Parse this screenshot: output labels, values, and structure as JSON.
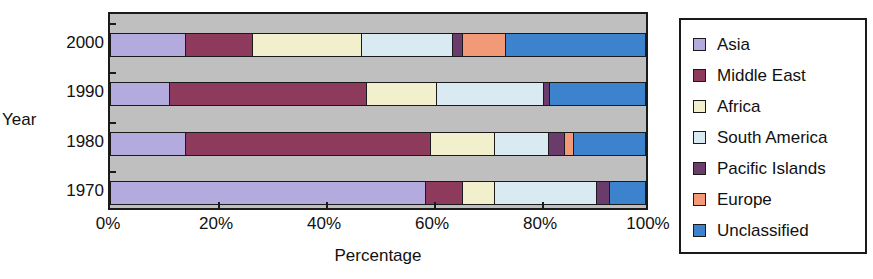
{
  "chart_data": {
    "type": "bar",
    "orientation": "horizontal",
    "stacked": true,
    "normalized": true,
    "title": "",
    "xlabel": "Percentage",
    "ylabel": "Year",
    "categories": [
      "2000",
      "1990",
      "1980",
      "1970"
    ],
    "category_order_top_to_bottom": [
      "2000",
      "1990",
      "1980",
      "1970"
    ],
    "xlim": [
      0,
      100
    ],
    "xtick_labels": [
      "0%",
      "20%",
      "40%",
      "60%",
      "80%",
      "100%"
    ],
    "xtick_values": [
      0,
      20,
      40,
      60,
      80,
      100
    ],
    "grid": false,
    "legend_position": "right",
    "series": [
      {
        "name": "Asia",
        "color": "#b3abdd",
        "values": [
          14.0,
          11.0,
          14.0,
          59.0
        ]
      },
      {
        "name": "Middle East",
        "color": "#8e3a5c",
        "values": [
          12.5,
          37.0,
          46.0,
          7.0
        ]
      },
      {
        "name": "Africa",
        "color": "#f2f0cc",
        "values": [
          20.5,
          13.0,
          12.0,
          6.0
        ]
      },
      {
        "name": "South America",
        "color": "#d9eaf3",
        "values": [
          17.0,
          20.0,
          10.0,
          19.0
        ]
      },
      {
        "name": "Pacific Islands",
        "color": "#6b3b6b",
        "values": [
          2.0,
          1.3,
          3.0,
          2.5
        ]
      },
      {
        "name": "Europe",
        "color": "#f29a78",
        "values": [
          8.0,
          0.0,
          1.7,
          0.0
        ]
      },
      {
        "name": "Unclassified",
        "color": "#3d82cc",
        "values": [
          26.0,
          17.7,
          13.3,
          6.5
        ]
      }
    ]
  },
  "axes": {
    "y_title": "Year",
    "x_title": "Percentage"
  },
  "legend": {
    "items": [
      {
        "label": "Asia",
        "color": "#b3abdd"
      },
      {
        "label": "Middle East",
        "color": "#8e3a5c"
      },
      {
        "label": "Africa",
        "color": "#f2f0cc"
      },
      {
        "label": "South America",
        "color": "#d9eaf3"
      },
      {
        "label": "Pacific Islands",
        "color": "#6b3b6b"
      },
      {
        "label": "Europe",
        "color": "#f29a78"
      },
      {
        "label": "Unclassified",
        "color": "#3d82cc"
      }
    ]
  },
  "style": {
    "plot_background": "#bfbfbf",
    "figure_background": "#ffffff",
    "axis_color": "#1a1a1a",
    "text_color": "#111111"
  }
}
